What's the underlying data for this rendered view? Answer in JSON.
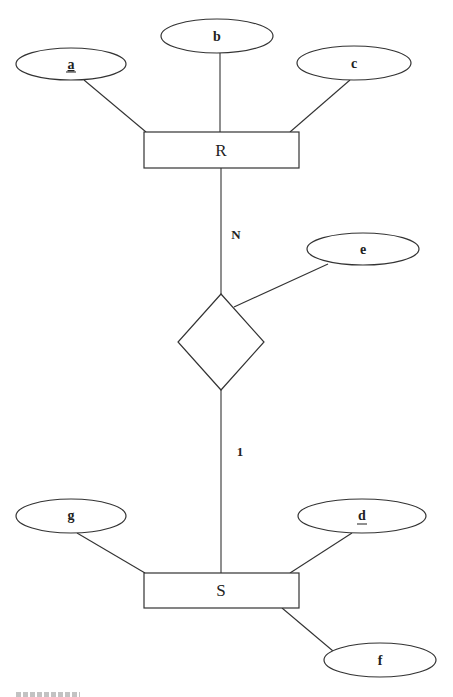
{
  "diagram": {
    "type": "ER diagram",
    "entities": [
      {
        "id": "R",
        "label": "R",
        "x": 144,
        "y": 132,
        "w": 155,
        "h": 36
      },
      {
        "id": "S",
        "label": "S",
        "x": 144,
        "y": 573,
        "w": 155,
        "h": 35
      }
    ],
    "relationship": {
      "label": "",
      "cx": 221,
      "cy": 342,
      "half_w": 43,
      "half_h": 48
    },
    "attributes": [
      {
        "id": "a",
        "label": "a",
        "key": true,
        "owner": "R",
        "cx": 71,
        "cy": 64,
        "rx": 55,
        "ry": 16
      },
      {
        "id": "b",
        "label": "b",
        "key": false,
        "owner": "R",
        "cx": 217,
        "cy": 36,
        "rx": 56,
        "ry": 17
      },
      {
        "id": "c",
        "label": "c",
        "key": false,
        "owner": "R",
        "cx": 354,
        "cy": 63,
        "rx": 57,
        "ry": 17
      },
      {
        "id": "e",
        "label": "e",
        "key": false,
        "owner": "relationship",
        "cx": 363,
        "cy": 249,
        "rx": 56,
        "ry": 16
      },
      {
        "id": "g",
        "label": "g",
        "key": false,
        "owner": "S",
        "cx": 71,
        "cy": 516,
        "rx": 55,
        "ry": 17
      },
      {
        "id": "d",
        "label": "d",
        "key": true,
        "owner": "S",
        "cx": 362,
        "cy": 516,
        "rx": 64,
        "ry": 17
      },
      {
        "id": "f",
        "label": "f",
        "key": false,
        "owner": "S",
        "cx": 380,
        "cy": 660,
        "rx": 56,
        "ry": 17
      }
    ],
    "cardinalities": [
      {
        "side": "R",
        "label": "N"
      },
      {
        "side": "S",
        "label": "1"
      }
    ],
    "caption": "(cropped, illegible)"
  },
  "labels": {
    "entity_R": "R",
    "entity_S": "S",
    "attr_a": "a",
    "attr_b": "b",
    "attr_c": "c",
    "attr_d": "d",
    "attr_e": "e",
    "attr_f": "f",
    "attr_g": "g",
    "card_R": "N",
    "card_S": "1"
  }
}
